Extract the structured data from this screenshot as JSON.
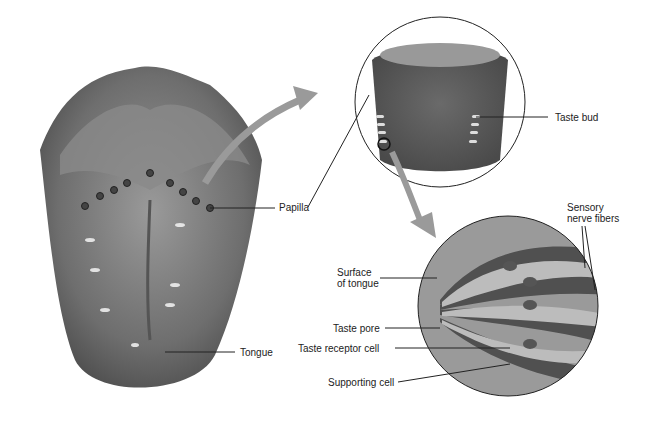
{
  "diagram": {
    "labels": {
      "papilla": "Papilla",
      "tongue": "Tongue",
      "taste_bud": "Taste bud",
      "sensory_line1": "Sensory",
      "sensory_line2": "nerve fibers",
      "surface_line1": "Surface",
      "surface_line2": "of tongue",
      "taste_pore": "Taste pore",
      "taste_receptor_cell": "Taste receptor cell",
      "supporting_cell": "Supporting cell"
    },
    "colors": {
      "tissue_dark": "#5a5a5a",
      "tissue_mid": "#7e7e7e",
      "tissue_light": "#a8a8a8",
      "arrow": "#9a9a9a",
      "line": "#222222"
    }
  }
}
